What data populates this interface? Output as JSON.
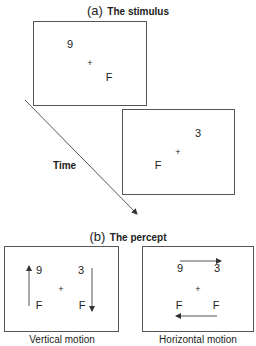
{
  "panel_a": {
    "letter": "(a)",
    "title": "The stimulus",
    "frame1": {
      "top_left": "9",
      "center": "+",
      "bottom_right": "F"
    },
    "frame2": {
      "top_right": "3",
      "center": "+",
      "bottom_left": "F"
    },
    "time_label": "Time"
  },
  "panel_b": {
    "letter": "(b)",
    "title": "The percept",
    "vertical": {
      "top_left": "9",
      "top_right": "3",
      "center": "+",
      "bottom_left": "F",
      "bottom_right": "F",
      "caption": "Vertical motion"
    },
    "horizontal": {
      "top_left": "9",
      "top_right": "3",
      "center": "+",
      "bottom_left": "F",
      "bottom_right": "F",
      "caption": "Horizontal motion"
    }
  },
  "colors": {
    "line": "#555555",
    "text": "#222222",
    "background": "#ffffff"
  }
}
